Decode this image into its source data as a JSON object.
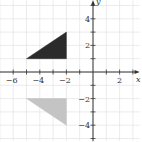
{
  "chart_data": {
    "type": "scatter",
    "title": "",
    "xlabel": "x",
    "ylabel": "y",
    "xlim": [
      -7,
      3.5
    ],
    "ylim": [
      -5.2,
      5.4
    ],
    "grid": true,
    "x_ticks": [
      -6,
      -5,
      -4,
      -3,
      -2,
      -1,
      1,
      2,
      3
    ],
    "y_ticks": [
      -5,
      -4,
      -3,
      -2,
      -1,
      1,
      2,
      3,
      4,
      5
    ],
    "x_tick_labels": [
      {
        "value": -6,
        "label": "−6"
      },
      {
        "value": -4,
        "label": "−4"
      },
      {
        "value": -2,
        "label": "−2"
      },
      {
        "value": 2,
        "label": "2"
      }
    ],
    "y_tick_labels": [
      {
        "value": 4,
        "label": "4"
      },
      {
        "value": 2,
        "label": "2"
      },
      {
        "value": -2,
        "label": "−2"
      },
      {
        "value": -4,
        "label": "−4"
      }
    ],
    "series": [
      {
        "name": "original-triangle",
        "shape": "polygon",
        "fill": "#2b2b2b",
        "vertices": [
          [
            -5,
            1
          ],
          [
            -2,
            1
          ],
          [
            -2,
            3
          ]
        ]
      },
      {
        "name": "image-triangle",
        "shape": "polygon",
        "fill": "#c4c4c4",
        "vertices": [
          [
            -5,
            -2
          ],
          [
            -2,
            -2
          ],
          [
            -2,
            -4
          ]
        ]
      }
    ]
  },
  "layout": {
    "origin_px": [
      93,
      72
    ],
    "unit_px": 13.3,
    "grid_color": "#e6e6e6",
    "axis_color": "#333333"
  }
}
